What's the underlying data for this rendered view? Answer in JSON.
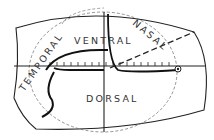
{
  "diagram": {
    "type": "retina-map",
    "labels": {
      "temporal": "TEMPORAL",
      "ventral": "VENTRAL",
      "nasal": "NASAL",
      "dorsal": "DORSAL"
    },
    "colors": {
      "line": "#222222",
      "dashed": "#555555",
      "background": "#ffffff"
    },
    "ticks": {
      "count": 20
    }
  }
}
